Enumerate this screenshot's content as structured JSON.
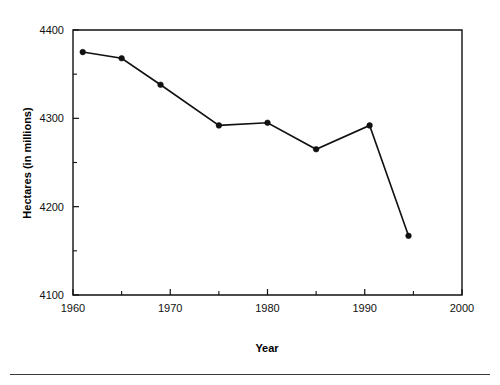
{
  "chart_data": {
    "type": "line",
    "title": "",
    "xlabel": "Year",
    "ylabel": "Hectares (in millions)",
    "xlim": [
      1960,
      2000
    ],
    "ylim": [
      4100,
      4400
    ],
    "grid": false,
    "legend": null,
    "x_major_ticks": [
      1960,
      1970,
      1980,
      1990,
      2000
    ],
    "x_major_tick_labels": [
      "1960",
      "1970",
      "1980",
      "1990",
      "2000"
    ],
    "x_minor_ticks": [
      1965,
      1975,
      1985,
      1995
    ],
    "y_major_ticks": [
      4100,
      4200,
      4300,
      4400
    ],
    "y_major_tick_labels": [
      "4100",
      "4200",
      "4300",
      "4400"
    ],
    "y_minor_ticks": [
      4150,
      4250,
      4350
    ],
    "series": [
      {
        "name": "Hectares",
        "x": [
          1961,
          1965,
          1969,
          1975,
          1980,
          1985,
          1990.5,
          1994.5
        ],
        "values": [
          4375,
          4368,
          4338,
          4292,
          4295,
          4265,
          4292,
          4167
        ],
        "marker": "filled-circle",
        "color": "#111111"
      }
    ]
  },
  "axis": {
    "y_label_text": "Hectares (in millions)",
    "x_label_text": "Year"
  },
  "colors": {
    "line": "#111111",
    "marker": "#111111",
    "frame": "#111111",
    "footer_rule": "#3a3a3a",
    "background": "#ffffff"
  }
}
